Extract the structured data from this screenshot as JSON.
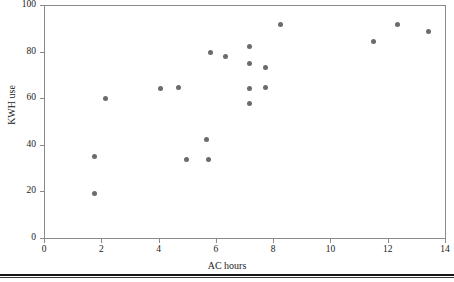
{
  "chart_data": {
    "type": "scatter",
    "title": "",
    "xlabel": "AC hours",
    "ylabel": "KWH use",
    "xlim": [
      0,
      14
    ],
    "ylim": [
      0,
      100
    ],
    "xticks": [
      0,
      2,
      4,
      6,
      8,
      10,
      12,
      14
    ],
    "yticks": [
      0,
      20,
      40,
      60,
      80,
      100
    ],
    "xtick_labels": [
      "0",
      "2",
      "4",
      "6",
      "8",
      "10",
      "12",
      "14"
    ],
    "ytick_labels": [
      "0",
      "20",
      "40",
      "60",
      "80",
      "100"
    ],
    "grid": false,
    "legend": false,
    "marker_color": "#6b6b6b",
    "axis_color": "#8a8a8a",
    "n_points": 20,
    "points": [
      {
        "x": 1.75,
        "y": 34.8
      },
      {
        "x": 1.75,
        "y": 18.9
      },
      {
        "x": 2.13,
        "y": 59.7
      },
      {
        "x": 4.08,
        "y": 64.0
      },
      {
        "x": 4.68,
        "y": 64.4
      },
      {
        "x": 4.99,
        "y": 33.9
      },
      {
        "x": 5.69,
        "y": 42.1
      },
      {
        "x": 5.76,
        "y": 33.5
      },
      {
        "x": 5.83,
        "y": 79.8
      },
      {
        "x": 6.32,
        "y": 78.1
      },
      {
        "x": 7.19,
        "y": 82.0
      },
      {
        "x": 7.19,
        "y": 75.1
      },
      {
        "x": 7.19,
        "y": 64.0
      },
      {
        "x": 7.19,
        "y": 57.9
      },
      {
        "x": 7.72,
        "y": 73.0
      },
      {
        "x": 7.72,
        "y": 64.4
      },
      {
        "x": 8.27,
        "y": 91.8
      },
      {
        "x": 11.49,
        "y": 84.5
      },
      {
        "x": 12.33,
        "y": 91.8
      },
      {
        "x": 13.44,
        "y": 88.8
      }
    ]
  }
}
